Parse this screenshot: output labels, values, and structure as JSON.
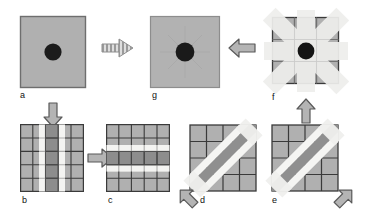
{
  "figure": {
    "title": "",
    "background_color": "#ffffff",
    "panel_fill": "#b0b0b0",
    "panel_border": "#6e6e6e",
    "grid_line_color": "#3a3a3a",
    "dark_band_color": "#8a8a8a",
    "light_band_color": "#f2f2f2",
    "blob_color": "#1a1a1a",
    "arrow_fill": "#b4b4b4",
    "arrow_stroke": "#555555"
  },
  "panels": [
    {
      "id": "a",
      "label": "a",
      "kind": "plain-square-with-blob",
      "description": "uniform gray square with dark circular blob at center",
      "grid": 0,
      "blob": true,
      "bands": []
    },
    {
      "id": "g",
      "label": "g",
      "kind": "plain-square-with-blob",
      "description": "uniform gray square with dark circular blob at center, result image",
      "grid": 0,
      "blob": true,
      "bands": []
    },
    {
      "id": "f",
      "label": "f",
      "kind": "star-kernel",
      "description": "square with overlapping vertical, horizontal and two diagonal light bands forming a star, dark blob at center",
      "grid": 3,
      "blob": true,
      "bands": [
        "vertical",
        "horizontal",
        "diagonal-down",
        "diagonal-up"
      ]
    },
    {
      "id": "b",
      "label": "b",
      "kind": "vertical-band-kernel",
      "description": "5 by 5 grid with dark vertical center band flanked by two light vertical bands",
      "grid": 5,
      "blob": false,
      "bands": [
        "vertical"
      ]
    },
    {
      "id": "c",
      "label": "c",
      "kind": "horizontal-band-kernel",
      "description": "5 by 5 grid with dark horizontal center band flanked by two light horizontal bands",
      "grid": 5,
      "blob": false,
      "bands": [
        "horizontal"
      ]
    },
    {
      "id": "d",
      "label": "d",
      "kind": "diagonal-band-kernel-up",
      "description": "4 by 4 grid with dark diagonal band running from lower-left to upper-right flanked by light bands",
      "grid": 4,
      "blob": false,
      "bands": [
        "diagonal-up"
      ]
    },
    {
      "id": "e",
      "label": "e",
      "kind": "diagonal-band-kernel-down",
      "description": "4 by 4 grid with dark diagonal band running from upper-left to lower-right flanked by light bands",
      "grid": 4,
      "blob": false,
      "bands": [
        "diagonal-down"
      ]
    }
  ],
  "arrows": [
    {
      "id": "a-to-g",
      "direction": "right",
      "style": "dashed",
      "from": "a",
      "to": "g"
    },
    {
      "id": "f-to-g",
      "direction": "left",
      "style": "solid",
      "from": "f",
      "to": "g"
    },
    {
      "id": "a-to-b",
      "direction": "down",
      "style": "solid",
      "from": "a",
      "to": "b"
    },
    {
      "id": "b-to-c",
      "direction": "right",
      "style": "solid",
      "from": "b",
      "to": "c"
    },
    {
      "id": "d-in",
      "direction": "up-right",
      "style": "solid",
      "from": "c",
      "to": "d"
    },
    {
      "id": "e-in",
      "direction": "up-left",
      "style": "solid",
      "from": "e",
      "to": "f"
    },
    {
      "id": "e-to-f",
      "direction": "up",
      "style": "solid",
      "from": "e",
      "to": "f"
    }
  ]
}
